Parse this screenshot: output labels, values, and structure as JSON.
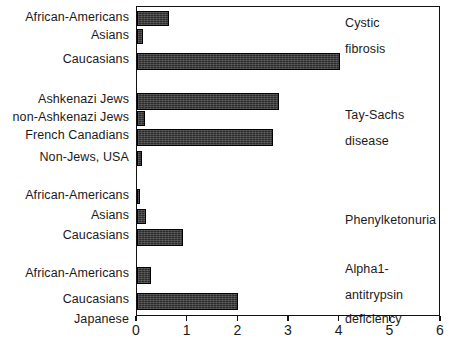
{
  "chart_data": {
    "type": "bar",
    "orientation": "horizontal",
    "title": "",
    "xlabel": "",
    "ylabel": "",
    "xlim": [
      0,
      6
    ],
    "xticks": [
      "0",
      "1",
      "2",
      "3",
      "4",
      "5",
      "6"
    ],
    "grid": false,
    "legend": "none",
    "groups": [
      {
        "annotation": [
          "Cystic",
          "fibrosis"
        ],
        "categories": [
          "African-Americans",
          "Asians",
          "Caucasians"
        ],
        "values": [
          0.63,
          0.12,
          4.0
        ]
      },
      {
        "annotation": [
          "Tay-Sachs",
          "disease"
        ],
        "categories": [
          "Ashkenazi Jews",
          "non-Ashkenazi Jews",
          "French Canadians",
          "Non-Jews, USA"
        ],
        "values": [
          2.8,
          0.16,
          2.68,
          0.1
        ]
      },
      {
        "annotation": [
          "Phenylketonuria"
        ],
        "categories": [
          "African-Americans",
          "Asians",
          "Caucasians"
        ],
        "values": [
          0.06,
          0.18,
          0.91
        ]
      },
      {
        "annotation": [
          "Alpha1-",
          "antitrypsin",
          "deficiency"
        ],
        "categories": [
          "African-Americans",
          "Caucasians",
          "Japanese"
        ],
        "values": [
          0.28,
          2.0,
          0.0
        ]
      }
    ],
    "categories": [
      "African-Americans",
      "Asians",
      "Caucasians",
      "Ashkenazi Jews",
      "non-Ashkenazi Jews",
      "French Canadians",
      "Non-Jews, USA",
      "African-Americans",
      "Asians",
      "Caucasians",
      "African-Americans",
      "Caucasians",
      "Japanese"
    ],
    "values": [
      0.63,
      0.12,
      4.0,
      2.8,
      0.16,
      2.68,
      0.1,
      0.06,
      0.18,
      0.91,
      0.28,
      2.0,
      0.0
    ],
    "annotations": [
      "Cystic fibrosis",
      "Tay-Sachs disease",
      "Phenylketonuria",
      "Alpha1-antitrypsin deficiency"
    ],
    "bar_color": "#2b2b2b"
  },
  "axis": {
    "ticks": [
      {
        "label": "0",
        "value": 0
      },
      {
        "label": "1",
        "value": 1
      },
      {
        "label": "2",
        "value": 2
      },
      {
        "label": "3",
        "value": 3
      },
      {
        "label": "4",
        "value": 4
      },
      {
        "label": "5",
        "value": 5
      },
      {
        "label": "6",
        "value": 6
      }
    ]
  },
  "rows": [
    {
      "label": "African-Americans",
      "value": 0.63
    },
    {
      "label": "Asians",
      "value": 0.12
    },
    {
      "label": "Caucasians",
      "value": 4.0
    },
    {
      "label": "Ashkenazi Jews",
      "value": 2.8
    },
    {
      "label": "non-Ashkenazi Jews",
      "value": 0.16
    },
    {
      "label": "French Canadians",
      "value": 2.68
    },
    {
      "label": "Non-Jews, USA",
      "value": 0.1
    },
    {
      "label": "African-Americans",
      "value": 0.06
    },
    {
      "label": "Asians",
      "value": 0.18
    },
    {
      "label": "Caucasians",
      "value": 0.91
    },
    {
      "label": "African-Americans",
      "value": 0.28
    },
    {
      "label": "Caucasians",
      "value": 2.0
    },
    {
      "label": "Japanese",
      "value": 0.0
    }
  ],
  "annotation_lines": [
    {
      "text": "Cystic"
    },
    {
      "text": "fibrosis"
    },
    {
      "text": "Tay-Sachs"
    },
    {
      "text": "disease"
    },
    {
      "text": "Phenylketonuria"
    },
    {
      "text": "Alpha1-"
    },
    {
      "text": "antitrypsin"
    },
    {
      "text": "deficiency"
    }
  ]
}
